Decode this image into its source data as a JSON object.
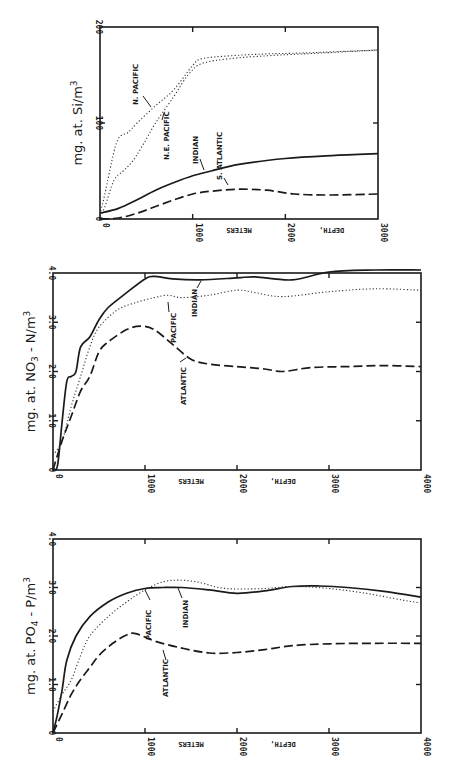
{
  "figure": {
    "panels": [
      "silicate",
      "nitrate",
      "phosphate"
    ]
  },
  "chart_data": [
    {
      "id": "silicate",
      "type": "line",
      "title": "",
      "xlabel": "DEPTH, METERS",
      "ylabel": "mg. at. Si/m³",
      "ylabel_parts": {
        "main": "mg. at. Si/m",
        "sup": "3"
      },
      "xlim": [
        0,
        3000
      ],
      "ylim": [
        0,
        200
      ],
      "xticks": [
        0,
        1000,
        2000,
        3000
      ],
      "yticks": [
        0,
        100,
        200
      ],
      "xtick_labels": [
        "0",
        "1000",
        "2000",
        "3000"
      ],
      "ytick_labels": [
        "0",
        "100",
        "200"
      ],
      "grid": false,
      "legend": "inline labels",
      "series": [
        {
          "name": "N. PACIFIC",
          "style": "dotted",
          "x": [
            0,
            50,
            150,
            200,
            250,
            300,
            400,
            600,
            800,
            1000,
            1100,
            1400,
            1800,
            2200,
            3000
          ],
          "y": [
            5,
            25,
            70,
            84,
            88,
            90,
            100,
            118,
            135,
            160,
            167,
            170,
            172,
            173,
            176
          ]
        },
        {
          "name": "N.E. PACIFIC",
          "style": "dotted",
          "x": [
            0,
            50,
            150,
            250,
            350,
            450,
            600,
            800,
            950,
            1100,
            1400,
            1800,
            2200,
            3000
          ],
          "y": [
            3,
            12,
            40,
            50,
            60,
            75,
            100,
            128,
            150,
            162,
            167,
            170,
            172,
            176
          ]
        },
        {
          "name": "INDIAN",
          "style": "solid",
          "x": [
            0,
            200,
            400,
            600,
            800,
            1000,
            1200,
            1500,
            2000,
            2500,
            3000
          ],
          "y": [
            6,
            11,
            20,
            30,
            38,
            45,
            50,
            57,
            63,
            66,
            68
          ]
        },
        {
          "name": "S. ATLANTIC",
          "style": "dashed",
          "x": [
            0,
            200,
            400,
            600,
            800,
            1000,
            1200,
            1500,
            1800,
            2100,
            2500,
            3000
          ],
          "y": [
            0,
            1,
            6,
            13,
            20,
            26,
            29,
            31,
            30,
            26,
            25,
            26
          ]
        }
      ]
    },
    {
      "id": "nitrate",
      "type": "line",
      "title": "",
      "xlabel": "DEPTH, METERS",
      "ylabel": "mg. at. NO₃ - N/m³",
      "ylabel_parts": {
        "main": "mg. at. NO",
        "sub": "3",
        "tail": " - N/m",
        "sup": "3"
      },
      "xlim": [
        0,
        4000
      ],
      "ylim": [
        0,
        4.0
      ],
      "xticks": [
        0,
        1000,
        2000,
        3000,
        4000
      ],
      "yticks": [
        0,
        1.0,
        2.0,
        3.0,
        4.0
      ],
      "xtick_labels": [
        "0",
        "1000",
        "2000",
        "3000",
        "4000"
      ],
      "ytick_labels": [
        "0",
        "1.0",
        "2.0",
        "3.0",
        "4.0"
      ],
      "grid": false,
      "legend": "inline labels",
      "series": [
        {
          "name": "INDIAN",
          "style": "solid",
          "x": [
            0,
            50,
            100,
            150,
            200,
            250,
            300,
            400,
            500,
            600,
            800,
            1000,
            1100,
            1300,
            1600,
            2000,
            2200,
            2600,
            3000,
            3500,
            4000
          ],
          "y": [
            0,
            0.1,
            1.0,
            1.8,
            1.9,
            2.0,
            2.5,
            2.7,
            3.05,
            3.3,
            3.6,
            3.88,
            3.93,
            3.88,
            3.86,
            3.9,
            3.92,
            3.86,
            4.02,
            4.06,
            4.06
          ]
        },
        {
          "name": "PACIFIC",
          "style": "dotted",
          "x": [
            0,
            100,
            200,
            300,
            400,
            500,
            700,
            900,
            1100,
            1250,
            1400,
            1700,
            2000,
            2200,
            2500,
            3000,
            3500,
            4000
          ],
          "y": [
            0.3,
            0.6,
            1.3,
            1.9,
            2.5,
            2.9,
            3.25,
            3.4,
            3.5,
            3.55,
            3.5,
            3.55,
            3.65,
            3.6,
            3.52,
            3.62,
            3.68,
            3.65
          ]
        },
        {
          "name": "ATLANTIC",
          "style": "dashed",
          "x": [
            0,
            100,
            200,
            300,
            400,
            500,
            600,
            800,
            950,
            1100,
            1300,
            1500,
            1700,
            2000,
            2300,
            2500,
            2800,
            3200,
            3600,
            4000
          ],
          "y": [
            0,
            0.6,
            1.1,
            1.6,
            1.9,
            2.4,
            2.6,
            2.85,
            2.92,
            2.85,
            2.55,
            2.25,
            2.15,
            2.1,
            2.05,
            2.0,
            2.08,
            2.1,
            2.12,
            2.1
          ]
        }
      ]
    },
    {
      "id": "phosphate",
      "type": "line",
      "title": "",
      "xlabel": "DEPTH, METERS",
      "ylabel": "mg. at. PO₄ - P/m³",
      "ylabel_parts": {
        "main": "mg. at. PO",
        "sub": "4",
        "tail": " - P/m",
        "sup": "3"
      },
      "xlim": [
        0,
        4000
      ],
      "ylim": [
        0,
        4.0
      ],
      "xticks": [
        0,
        1000,
        2000,
        3000,
        4000
      ],
      "yticks": [
        0,
        1.0,
        2.0,
        3.0,
        4.0
      ],
      "xtick_labels": [
        "0",
        "1000",
        "2000",
        "3000",
        "4000"
      ],
      "ytick_labels": [
        "0",
        "1.0",
        "2.0",
        "3.0",
        "4.0"
      ],
      "grid": false,
      "legend": "inline labels",
      "series": [
        {
          "name": "INDIAN",
          "style": "solid",
          "x": [
            0,
            50,
            100,
            150,
            250,
            400,
            600,
            800,
            1000,
            1200,
            1400,
            1700,
            2000,
            2300,
            2600,
            2900,
            3200,
            3600,
            4000
          ],
          "y": [
            0,
            0.4,
            0.9,
            1.5,
            2.0,
            2.4,
            2.7,
            2.88,
            2.98,
            3.0,
            3.0,
            2.95,
            2.88,
            2.93,
            3.02,
            3.03,
            3.0,
            2.92,
            2.8
          ]
        },
        {
          "name": "PACIFIC",
          "style": "dotted",
          "x": [
            0,
            100,
            200,
            300,
            400,
            600,
            800,
            1000,
            1200,
            1400,
            1600,
            1800,
            2000,
            2300,
            2600,
            3000,
            3400,
            3800,
            4000
          ],
          "y": [
            0.45,
            0.8,
            1.1,
            1.6,
            2.0,
            2.4,
            2.7,
            2.95,
            3.12,
            3.15,
            3.1,
            3.0,
            2.97,
            2.98,
            3.02,
            2.98,
            2.88,
            2.74,
            2.68
          ]
        },
        {
          "name": "ATLANTIC",
          "style": "dashed",
          "x": [
            0,
            100,
            200,
            300,
            400,
            500,
            650,
            800,
            900,
            1100,
            1400,
            1700,
            2000,
            2300,
            2600,
            3000,
            3500,
            4000
          ],
          "y": [
            0,
            0.4,
            0.8,
            1.1,
            1.35,
            1.6,
            1.85,
            2.02,
            2.05,
            1.9,
            1.75,
            1.65,
            1.66,
            1.72,
            1.8,
            1.84,
            1.85,
            1.85
          ]
        }
      ]
    }
  ]
}
